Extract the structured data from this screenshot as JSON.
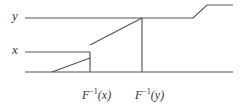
{
  "diagram": {
    "type": "quantile-function-illustration",
    "y_axis_labels": {
      "y": "y",
      "x": "x"
    },
    "x_axis_labels": {
      "finv_x": {
        "base": "F",
        "exponent": "−1",
        "arg": "(x)"
      },
      "finv_y": {
        "base": "F",
        "exponent": "−1",
        "arg": "(y)"
      }
    },
    "line_color": "#555555"
  }
}
